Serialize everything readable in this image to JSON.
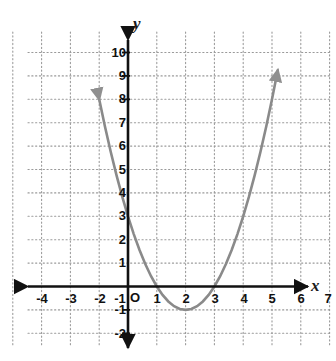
{
  "figure": {
    "kind": "coordinate-grid-parabola",
    "background_color": "#ffffff",
    "axis_color": "#111111",
    "grid_color": "#9a9a9a",
    "curve_color": "#8a8a8a"
  },
  "axes": {
    "x_letter": "x",
    "y_letter": "y",
    "origin_letter": "O",
    "x_tick_labels": [
      "-4",
      "-3",
      "-2",
      "-1",
      "1",
      "2",
      "3",
      "4",
      "5",
      "6",
      "7"
    ],
    "y_tick_labels": [
      "10",
      "9",
      "8",
      "7",
      "6",
      "5",
      "4",
      "3",
      "2",
      "1",
      "-1",
      "-2"
    ]
  },
  "chart_data": {
    "type": "line",
    "title": "",
    "xlabel": "x",
    "ylabel": "y",
    "xlim": [
      -4.6,
      7.6
    ],
    "ylim": [
      -2.6,
      10.6
    ],
    "xticks": [
      -4,
      -3,
      -2,
      -1,
      1,
      2,
      3,
      4,
      5,
      6,
      7
    ],
    "yticks": [
      10,
      9,
      8,
      7,
      6,
      5,
      4,
      3,
      2,
      1,
      -1,
      -2
    ],
    "grid": true,
    "grid_style": "dotted",
    "legend": "none",
    "series": [
      {
        "name": "y = x^2 - 4x + 3",
        "equation": "y = x^2 - 4x + 3",
        "vertex": [
          2,
          -1
        ],
        "roots": [
          1,
          3
        ],
        "y_intercept": 3,
        "arrow_start": true,
        "arrow_end": true,
        "x": [
          -1.0,
          -0.8,
          -0.6,
          -0.4,
          -0.2,
          0.0,
          0.2,
          0.4,
          0.6,
          0.8,
          1.0,
          1.2,
          1.4,
          1.6,
          1.8,
          2.0,
          2.2,
          2.4,
          2.6,
          2.8,
          3.0,
          3.2,
          3.4,
          3.6,
          3.8,
          4.0,
          4.2,
          4.4,
          4.6,
          4.8,
          5.0,
          5.2
        ],
        "y": [
          8.0,
          6.84,
          5.76,
          4.76,
          3.84,
          3.0,
          2.24,
          1.56,
          0.96,
          0.44,
          0.0,
          -0.36,
          -0.64,
          -0.84,
          -0.96,
          -1.0,
          -0.96,
          -0.84,
          -0.64,
          -0.36,
          0.0,
          0.44,
          0.96,
          1.56,
          2.24,
          3.0,
          3.84,
          4.76,
          5.76,
          6.84,
          8.0,
          9.24
        ]
      }
    ]
  }
}
